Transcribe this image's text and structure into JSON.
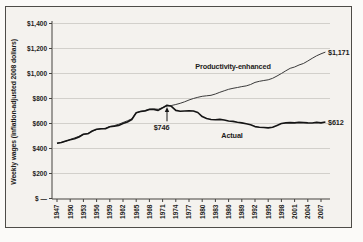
{
  "chart_data": {
    "type": "line",
    "title": "",
    "xlabel": "",
    "ylabel": "Weekly wages (inflation-adjusted 2008 dollars)",
    "ylim": [
      0,
      1400
    ],
    "ytick_interval": 200,
    "ytick_values": [
      0,
      200,
      400,
      600,
      800,
      1000,
      1200,
      1400
    ],
    "ytick_labels": [
      "$ —",
      "$200",
      "$400",
      "$600",
      "$800",
      "$1,000",
      "$1,200",
      "$1,400"
    ],
    "xtick_labels": [
      "1947",
      "1950",
      "1953",
      "1956",
      "1959",
      "1962",
      "1965",
      "1968",
      "1971",
      "1974",
      "1977",
      "1980",
      "1983",
      "1986",
      "1989",
      "1992",
      "1995",
      "1998",
      "2001",
      "2004",
      "2007"
    ],
    "x_start": 1947,
    "x_end": 2008,
    "grid": "horizontal",
    "legend_position": "inline-labels",
    "series": [
      {
        "name": "Productivity-enhanced",
        "end_label": "$1,171",
        "end_value": 1171,
        "values": [
          442,
          450,
          458,
          472,
          485,
          498,
          514,
          520,
          538,
          552,
          558,
          562,
          576,
          583,
          594,
          608,
          622,
          638,
          686,
          698,
          704,
          716,
          718,
          714,
          728,
          740,
          744,
          752,
          762,
          774,
          788,
          800,
          810,
          818,
          822,
          826,
          836,
          850,
          862,
          874,
          882,
          888,
          895,
          901,
          912,
          929,
          938,
          944,
          950,
          962,
          980,
          1000,
          1022,
          1042,
          1052,
          1068,
          1080,
          1100,
          1122,
          1142,
          1158,
          1171
        ]
      },
      {
        "name": "Actual",
        "end_label": "$612",
        "end_value": 612,
        "values": [
          442,
          448,
          460,
          470,
          478,
          492,
          514,
          518,
          540,
          554,
          558,
          558,
          574,
          578,
          585,
          600,
          612,
          632,
          686,
          696,
          700,
          712,
          712,
          705,
          725,
          746,
          738,
          705,
          698,
          700,
          702,
          700,
          688,
          655,
          640,
          632,
          630,
          633,
          628,
          620,
          617,
          610,
          605,
          598,
          590,
          575,
          570,
          568,
          565,
          570,
          585,
          600,
          605,
          607,
          605,
          609,
          607,
          605,
          604,
          609,
          605,
          612
        ]
      }
    ],
    "annotation": {
      "label": "$746",
      "year": 1972,
      "value": 746
    },
    "colors": {
      "productivity_line": "#3b3b3b",
      "actual_line": "#151515",
      "gridline": "#c9c6c1",
      "axis": "#44423e",
      "frame_border": "#4e4c48",
      "plot_background": "#f4f2ee",
      "page_background": "#fbfaf8",
      "text": "#1d1c1a"
    }
  }
}
